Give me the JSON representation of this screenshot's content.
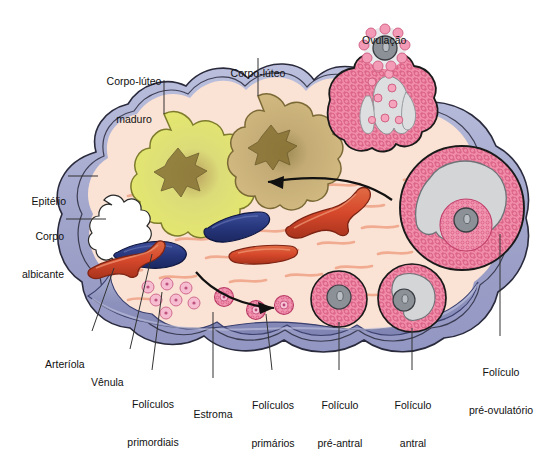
{
  "figure": {
    "title_visible": false,
    "language": "pt-BR"
  },
  "labels": [
    {
      "id": "corpo-luteo-maduro",
      "text": "Corpo-lúteo\nmaduro",
      "line1": "Corpo-lúteo",
      "line2": "maduro",
      "x": 131,
      "y": 52,
      "align": "center",
      "leader": {
        "x1": 164,
        "y1": 80,
        "x2": 164,
        "y2": 114
      }
    },
    {
      "id": "corpo-luteo",
      "text": "Corpo-lúteo",
      "line1": "Corpo-lúteo",
      "line2": "",
      "x": 222,
      "y": 44,
      "align": "center",
      "leader": {
        "x1": 258,
        "y1": 58,
        "x2": 258,
        "y2": 96
      }
    },
    {
      "id": "ovulacao",
      "text": "Ovulação",
      "line1": "Ovulação",
      "line2": "",
      "x": 362,
      "y": 9,
      "align": "left",
      "leader": null
    },
    {
      "id": "epitelio",
      "text": "Epitélio",
      "line1": "Epitélio",
      "line2": "",
      "x": 20,
      "y": 170,
      "align": "left",
      "leader": {
        "x1": 68,
        "y1": 176,
        "x2": 96,
        "y2": 176
      }
    },
    {
      "id": "corpo-albicante",
      "text": "Corpo\nalbicante",
      "line1": "Corpo",
      "line2": "albicante",
      "x": 14,
      "y": 205,
      "align": "left",
      "leader": {
        "x1": 66,
        "y1": 219,
        "x2": 104,
        "y2": 219
      }
    },
    {
      "id": "arteriola",
      "text": "Arteríola",
      "line1": "Arteríola",
      "line2": "",
      "x": 48,
      "y": 334,
      "align": "left",
      "leader": {
        "x1": 92,
        "y1": 331,
        "x2": 112,
        "y2": 268
      }
    },
    {
      "id": "venula",
      "text": "Vênula",
      "line1": "Vênula",
      "line2": "",
      "x": 94,
      "y": 352,
      "align": "left",
      "leader": {
        "x1": 130,
        "y1": 349,
        "x2": 152,
        "y2": 253
      }
    },
    {
      "id": "foliculos-primordiais",
      "text": "Folículos\nprimordiais",
      "line1": "Folículos",
      "line2": "primordiais",
      "x": 104,
      "y": 374,
      "align": "center",
      "leader": {
        "x1": 152,
        "y1": 372,
        "x2": 160,
        "y2": 290
      }
    },
    {
      "id": "estroma",
      "text": "Estroma",
      "line1": "Estroma",
      "line2": "",
      "x": 190,
      "y": 383,
      "align": "center",
      "leader": {
        "x1": 213,
        "y1": 380,
        "x2": 213,
        "y2": 310
      }
    },
    {
      "id": "foliculos-primarios",
      "text": "Folículos\nprimários",
      "line1": "Folículos",
      "line2": "primários",
      "x": 240,
      "y": 374,
      "align": "center",
      "leader": {
        "x1": 272,
        "y1": 372,
        "x2": 272,
        "y2": 310
      }
    },
    {
      "id": "foliculo-pre-antral",
      "text": "Folículo\npré-antral",
      "line1": "Folículo",
      "line2": "pré-antral",
      "x": 307,
      "y": 374,
      "align": "center",
      "leader": {
        "x1": 339,
        "y1": 372,
        "x2": 339,
        "y2": 312
      }
    },
    {
      "id": "foliculo-antral",
      "text": "Folículo\nantral",
      "line1": "Folículo",
      "line2": "antral",
      "x": 385,
      "y": 374,
      "align": "center",
      "leader": {
        "x1": 412,
        "y1": 372,
        "x2": 412,
        "y2": 316
      }
    },
    {
      "id": "foliculo-pre-ovulatorio",
      "text": "Folículo\npré-ovulatório",
      "line1": "Folículo",
      "line2": "pré-ovulatório",
      "x": 469,
      "y": 341,
      "align": "center",
      "leader": {
        "x1": 500,
        "y1": 338,
        "x2": 500,
        "y2": 232
      }
    }
  ],
  "structures": [
    {
      "id": "tunica-albuginea",
      "name": "túnica albugínea / cápsula",
      "color": "#a3a6cd"
    },
    {
      "id": "epithelium-layer",
      "name": "epitélio germinativo",
      "color": "#bcbfdd"
    },
    {
      "id": "cortex-stroma",
      "name": "estroma cortical",
      "color": "#fae0d2"
    },
    {
      "id": "medulla",
      "name": "medula",
      "color": "#8e93bd"
    },
    {
      "id": "corpus-luteum-mature",
      "name": "corpo-lúteo maduro",
      "color": "#e2e572"
    },
    {
      "id": "corpus-luteum",
      "name": "corpo-lúteo",
      "color": "#cbb278"
    },
    {
      "id": "corpus-albicans",
      "name": "corpo albicante",
      "color": "#ffffff"
    },
    {
      "id": "ruptured-follicle",
      "name": "folículo rompido (ovulação)",
      "color": "#ef7f9e"
    },
    {
      "id": "preovulatory-follicle",
      "name": "folículo pré-ovulatório",
      "color": "#ef7f9e"
    },
    {
      "id": "antral-follicle",
      "name": "folículo antral",
      "color": "#ef7f9e"
    },
    {
      "id": "preantral-follicle",
      "name": "folículo pré-antral",
      "color": "#ef7f9e"
    },
    {
      "id": "primary-follicles",
      "name": "folículos primários",
      "color": "#f08ba8"
    },
    {
      "id": "primordial-follicles",
      "name": "folículos primordiais",
      "color": "#f3a9c0"
    },
    {
      "id": "arteriole",
      "name": "arteríola",
      "color": "#d9472a"
    },
    {
      "id": "venule",
      "name": "vênula",
      "color": "#2b3a80"
    },
    {
      "id": "oocyte",
      "name": "ovócito",
      "color": "#8a9099"
    },
    {
      "id": "antrum",
      "name": "antro folicular",
      "color": "#d2d4d6"
    }
  ],
  "arrows": [
    {
      "id": "arrow-upper",
      "direction": "left",
      "description": "seta superior indicando progressão para o corpo-lúteo"
    },
    {
      "id": "arrow-lower",
      "direction": "right",
      "description": "seta inferior indicando crescimento folicular"
    }
  ],
  "colors": {
    "capsule": "#a3a6cd",
    "capsule_inner": "#c7cae4",
    "cortex": "#fae2d4",
    "medulla": "#8e93bd",
    "medulla_light": "#a8adcf",
    "corpus_luteum_mature": "#e3e66f",
    "corpus_luteum": "#cdb479",
    "follicle_pink": "#ef7f9e",
    "follicle_pink_light": "#f5a8bf",
    "antrum_gray": "#d3d5d7",
    "oocyte_gray": "#8c9198",
    "artery_red": "#d6482b",
    "vein_blue": "#26357a",
    "stroma_fiber": "#f0a98e",
    "outline": "#1a1a1a",
    "label_text": "#111111",
    "leader_line": "#333333"
  }
}
